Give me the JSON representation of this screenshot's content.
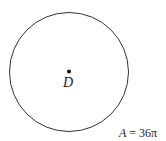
{
  "diagram": {
    "shape": "circle",
    "center_label": "D",
    "area_label_var": "A",
    "area_label_eq": " = 36π",
    "area_label": "A = 36π",
    "stroke_color": "#333333",
    "background": "#ffffff"
  }
}
